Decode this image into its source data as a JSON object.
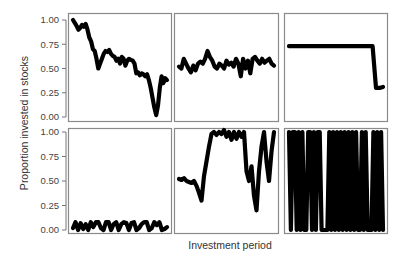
{
  "chart_data": {
    "type": "line",
    "layout": "facet-grid 2x3",
    "xlabel": "Investment period",
    "ylabel": "Proportion invested in stocks",
    "ylim": [
      0,
      1
    ],
    "yticks": [
      "1.00",
      "0.75",
      "0.50",
      "0.25",
      "0.00"
    ],
    "ytick_values": [
      1.0,
      0.75,
      0.5,
      0.25,
      0.0
    ],
    "grid": false,
    "legend": null,
    "line_color": "#000000",
    "panel_border_color": "#8a8a8a",
    "panels": [
      {
        "row": 0,
        "col": 0,
        "description": "declining from 1.0 to near 0 then rebounding to ~0.4",
        "values": [
          1.0,
          0.97,
          0.94,
          0.9,
          0.92,
          0.95,
          0.93,
          0.96,
          0.9,
          0.82,
          0.78,
          0.7,
          0.68,
          0.6,
          0.5,
          0.55,
          0.6,
          0.65,
          0.68,
          0.67,
          0.69,
          0.65,
          0.63,
          0.62,
          0.58,
          0.6,
          0.55,
          0.62,
          0.6,
          0.53,
          0.58,
          0.6,
          0.59,
          0.58,
          0.55,
          0.45,
          0.46,
          0.43,
          0.45,
          0.44,
          0.42,
          0.44,
          0.38,
          0.3,
          0.2,
          0.1,
          0.02,
          0.12,
          0.3,
          0.42,
          0.35,
          0.4,
          0.38
        ]
      },
      {
        "row": 0,
        "col": 1,
        "description": "fluctuating around 0.5-0.6",
        "values": [
          0.52,
          0.5,
          0.6,
          0.55,
          0.5,
          0.46,
          0.53,
          0.48,
          0.55,
          0.57,
          0.55,
          0.6,
          0.68,
          0.62,
          0.58,
          0.52,
          0.5,
          0.55,
          0.53,
          0.5,
          0.58,
          0.54,
          0.56,
          0.52,
          0.6,
          0.55,
          0.42,
          0.6,
          0.5,
          0.58,
          0.45,
          0.6,
          0.62,
          0.58,
          0.55,
          0.6,
          0.56,
          0.58,
          0.6,
          0.55,
          0.53
        ]
      },
      {
        "row": 0,
        "col": 2,
        "description": "constant ~0.73 then drop to ~0.3 at end",
        "values": [
          0.73,
          0.73,
          0.73,
          0.73,
          0.73,
          0.73,
          0.73,
          0.73,
          0.73,
          0.73,
          0.73,
          0.73,
          0.73,
          0.73,
          0.73,
          0.73,
          0.73,
          0.73,
          0.73,
          0.73,
          0.73,
          0.73,
          0.73,
          0.73,
          0.73,
          0.3,
          0.3,
          0.31
        ]
      },
      {
        "row": 1,
        "col": 0,
        "description": "oscillating near 0 between 0.0 and 0.1",
        "values": [
          0.02,
          0.08,
          0.0,
          0.07,
          0.01,
          0.06,
          0.0,
          0.08,
          0.03,
          0.08,
          0.08,
          0.02,
          0.0,
          0.08,
          0.08,
          0.0,
          0.06,
          0.08,
          0.0,
          0.06,
          0.08,
          0.07,
          0.0,
          0.07,
          0.08,
          0.0,
          0.02,
          0.06,
          0.08,
          0.08,
          0.0,
          0.02,
          0.08,
          0.05,
          0.08,
          0.0,
          0.01,
          0.03
        ]
      },
      {
        "row": 1,
        "col": 1,
        "description": "~0.5 dipping to 0.3, jump to ~1.0, plateau with noise, then large swings",
        "values": [
          0.52,
          0.51,
          0.53,
          0.5,
          0.49,
          0.48,
          0.5,
          0.45,
          0.38,
          0.3,
          0.55,
          0.7,
          0.85,
          0.98,
          1.0,
          0.97,
          1.0,
          0.98,
          1.02,
          0.95,
          1.0,
          0.92,
          1.0,
          0.93,
          1.0,
          0.95,
          1.0,
          0.6,
          0.5,
          0.65,
          0.35,
          0.2,
          0.6,
          0.85,
          1.0,
          0.7,
          0.5,
          0.8,
          1.0
        ]
      },
      {
        "row": 1,
        "col": 2,
        "description": "rapid binary switching between 0 and 1",
        "values": [
          1,
          0,
          1,
          1,
          0,
          1,
          0,
          1,
          0,
          0,
          1,
          1,
          0,
          1,
          0,
          1,
          1,
          0,
          0,
          0,
          0,
          1,
          0,
          1,
          0,
          1,
          0,
          1,
          0,
          1,
          0,
          1,
          0,
          1,
          0,
          1,
          0,
          0,
          1,
          0,
          1,
          0,
          0,
          0,
          1,
          0,
          1,
          0,
          1,
          0
        ]
      }
    ]
  }
}
